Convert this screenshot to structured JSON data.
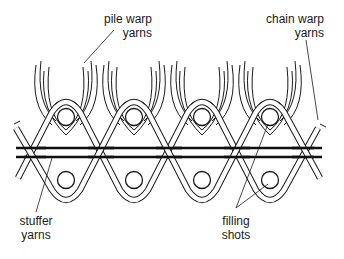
{
  "figure": {
    "type": "cross-section diagram",
    "colors": {
      "background": "#ffffff",
      "line": "#1a1a1a",
      "stuffer": "#111111"
    }
  },
  "labels": {
    "pile_warp": {
      "line1": "pile warp",
      "line2": "yarns"
    },
    "chain_warp": {
      "line1": "chain warp",
      "line2": "yarns"
    },
    "stuffer": {
      "line1": "stuffer",
      "line2": "yarns"
    },
    "filling": {
      "line1": "filling",
      "line2": "shots"
    }
  },
  "structure": {
    "repeat_count": 4,
    "filling_shots_upper": 4,
    "filling_shots_lower": 4,
    "stuffer_yarns": 2
  }
}
